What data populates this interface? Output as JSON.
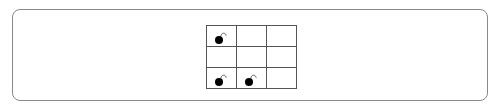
{
  "game": {
    "type": "grid-board",
    "rows": 3,
    "cols": 3,
    "cells": [
      [
        {
          "content": "bomb"
        },
        {
          "content": ""
        },
        {
          "content": ""
        }
      ],
      [
        {
          "content": ""
        },
        {
          "content": ""
        },
        {
          "content": ""
        }
      ],
      [
        {
          "content": "bomb"
        },
        {
          "content": "bomb"
        },
        {
          "content": ""
        }
      ]
    ],
    "icons": {
      "bomb": "bomb-icon"
    },
    "colors": {
      "grid_line": "#555555",
      "frame_border": "#8a8a8a",
      "bomb": "#000000"
    }
  }
}
